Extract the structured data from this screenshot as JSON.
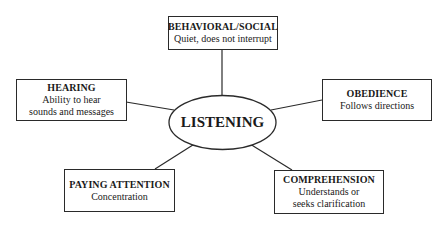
{
  "diagram": {
    "center": {
      "label": "LISTENING"
    },
    "nodes": [
      {
        "id": "behavioral",
        "title": "BEHAVIORAL/SOCIAL",
        "desc": [
          "Quiet, does not interrupt"
        ]
      },
      {
        "id": "hearing",
        "title": "HEARING",
        "desc": [
          "Ability to hear",
          "sounds and messages"
        ]
      },
      {
        "id": "obedience",
        "title": "OBEDIENCE",
        "desc": [
          "Follows directions"
        ]
      },
      {
        "id": "paying-attention",
        "title": "PAYING ATTENTION",
        "desc": [
          "Concentration"
        ]
      },
      {
        "id": "comprehension",
        "title": "COMPREHENSION",
        "desc": [
          "Understands or",
          "seeks clarification"
        ]
      }
    ],
    "colors": {
      "line": "#2a2a2a",
      "background": "#ffffff",
      "text": "#1a1a1a"
    }
  }
}
